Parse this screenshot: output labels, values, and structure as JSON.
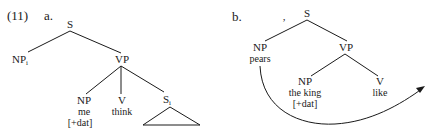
{
  "example": {
    "number": "(11)",
    "a": {
      "label": "a.",
      "nodes": {
        "S": "S",
        "NPi": "NP",
        "NPi_sub": "i",
        "VP": "VP",
        "NP": "NP",
        "NP_word": "me",
        "NP_feature": "[+dat]",
        "V": "V",
        "V_word": "think",
        "Si": "S",
        "Si_sub": "i"
      }
    },
    "b": {
      "label": "b.",
      "mark": ",",
      "nodes": {
        "S": "S",
        "NP1": "NP",
        "NP1_word": "pears",
        "VP": "VP",
        "NP2": "NP",
        "NP2_word": "the king",
        "NP2_feature": "[+dat]",
        "V": "V",
        "V_word": "like"
      },
      "arrow": "movement-arrow from NP pears to position after V like"
    }
  }
}
